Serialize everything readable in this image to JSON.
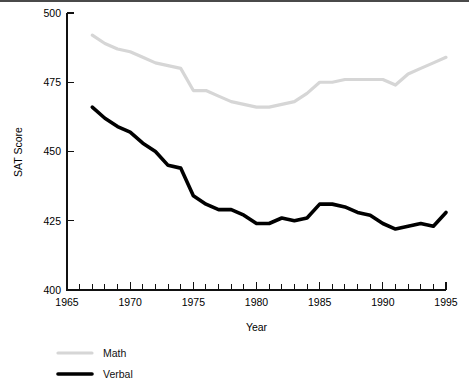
{
  "chart_data": {
    "type": "line",
    "title": "",
    "xlabel": "Year",
    "ylabel": "SAT Score",
    "xlim": [
      1965,
      1995
    ],
    "ylim": [
      400,
      500
    ],
    "grid": false,
    "legend_position": "below-left",
    "x_tick_labels": [
      "1965",
      "1970",
      "1975",
      "1980",
      "1985",
      "1990",
      "1995"
    ],
    "x_tick_values": [
      1965,
      1970,
      1975,
      1980,
      1985,
      1990,
      1995
    ],
    "x_minor_step": 1,
    "y_tick_labels": [
      "400",
      "425",
      "450",
      "475",
      "500"
    ],
    "y_tick_values": [
      400,
      425,
      450,
      475,
      500
    ],
    "x": [
      1967,
      1968,
      1969,
      1970,
      1971,
      1972,
      1973,
      1974,
      1975,
      1976,
      1977,
      1978,
      1979,
      1980,
      1981,
      1982,
      1983,
      1984,
      1985,
      1986,
      1987,
      1988,
      1989,
      1990,
      1991,
      1992,
      1993,
      1994,
      1995
    ],
    "series": [
      {
        "name": "Math",
        "color": "#d6d6d6",
        "width": 3.2,
        "values": [
          492,
          489,
          487,
          486,
          484,
          482,
          481,
          480,
          472,
          472,
          470,
          468,
          467,
          466,
          466,
          467,
          468,
          471,
          475,
          475,
          476,
          476,
          476,
          476,
          474,
          478,
          480,
          482,
          484
        ]
      },
      {
        "name": "Verbal",
        "color": "#000000",
        "width": 3.6,
        "values": [
          466,
          462,
          459,
          457,
          453,
          450,
          445,
          444,
          434,
          431,
          429,
          429,
          427,
          424,
          424,
          426,
          425,
          426,
          431,
          431,
          430,
          428,
          427,
          424,
          422,
          423,
          424,
          423,
          428
        ]
      }
    ]
  },
  "legend": {
    "items": [
      {
        "label": "Math",
        "color": "#d6d6d6",
        "width": 3.2
      },
      {
        "label": "Verbal",
        "color": "#000000",
        "width": 3.6
      }
    ]
  }
}
